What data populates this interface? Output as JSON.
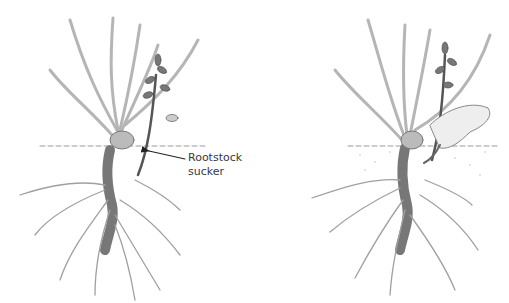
{
  "figure": {
    "panels": [
      {
        "id": "left",
        "label_lines": [
          "Rootstock",
          "sucker"
        ]
      },
      {
        "id": "right",
        "label_lines": []
      }
    ],
    "colors": {
      "ink": "#555555",
      "light_ink": "#9a9a9a",
      "soil_line": "#8a8a8a",
      "text": "#3a3a3a"
    }
  }
}
